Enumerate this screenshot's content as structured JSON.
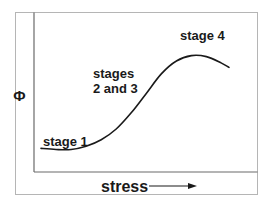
{
  "chart_data": {
    "type": "line",
    "title": "",
    "xlabel": "stress",
    "ylabel": "Φ",
    "xlim": [
      0,
      1
    ],
    "ylim": [
      0,
      1
    ],
    "grid": false,
    "axis_ticks": "none",
    "x_direction_arrow": true,
    "series": [
      {
        "name": "Φ vs stress",
        "color": "#1a1a1a",
        "x": [
          0.0,
          0.08,
          0.16,
          0.24,
          0.32,
          0.4,
          0.48,
          0.56,
          0.64,
          0.72,
          0.8,
          0.88,
          0.96,
          1.0
        ],
        "y": [
          0.07,
          0.06,
          0.06,
          0.09,
          0.15,
          0.25,
          0.4,
          0.58,
          0.76,
          0.88,
          0.93,
          0.92,
          0.86,
          0.82
        ]
      }
    ],
    "annotations": [
      {
        "text": "stage 1",
        "x": 0.03,
        "y": 0.13
      },
      {
        "text": "stages",
        "x": 0.27,
        "y": 0.6
      },
      {
        "text": "2 and 3",
        "x": 0.27,
        "y": 0.5
      },
      {
        "text": "stage 4",
        "x": 0.74,
        "y": 1.0
      }
    ]
  }
}
